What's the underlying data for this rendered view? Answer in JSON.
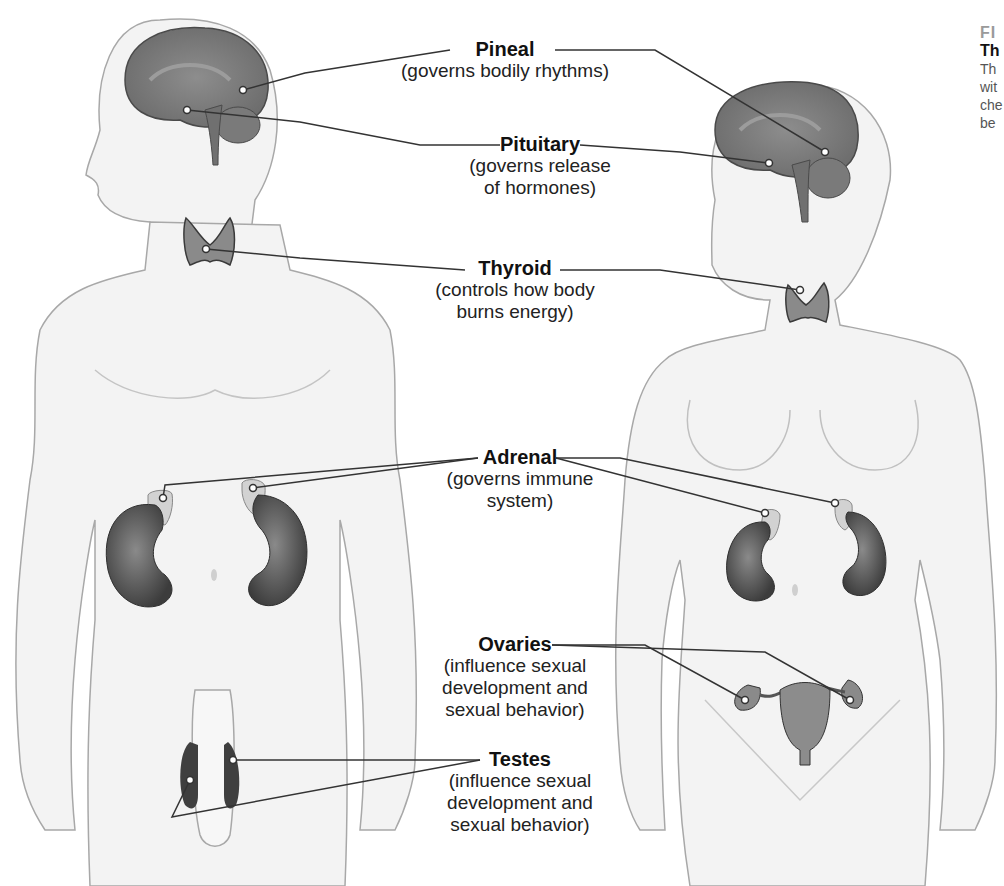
{
  "labels": {
    "pineal": {
      "title": "Pineal",
      "desc": "(governs bodily rhythms)"
    },
    "pituitary": {
      "title": "Pituitary",
      "desc_1": "(governs release",
      "desc_2": "of hormones)"
    },
    "thyroid": {
      "title": "Thyroid",
      "desc_1": "(controls how body",
      "desc_2": "burns energy)"
    },
    "adrenal": {
      "title": "Adrenal",
      "desc_1": "(governs immune",
      "desc_2": "system)"
    },
    "ovaries": {
      "title": "Ovaries",
      "desc_1": "(influence sexual",
      "desc_2": "development and",
      "desc_3": "sexual behavior)"
    },
    "testes": {
      "title": "Testes",
      "desc_1": "(influence sexual",
      "desc_2": "development and",
      "desc_3": "sexual behavior)"
    }
  },
  "caption": {
    "fig": "FI",
    "title": "Th",
    "lines": [
      "Th",
      "wit",
      "che",
      "be"
    ]
  },
  "colors": {
    "skin": "#f2f2f2",
    "outline": "#9a9a9a",
    "organ_dark": "#5a5a5a",
    "organ_mid": "#7c7c7c",
    "adrenal": "#cfcfcf",
    "leader": "#333333"
  }
}
